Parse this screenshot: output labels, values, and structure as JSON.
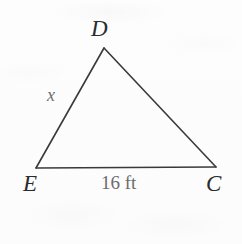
{
  "figure": {
    "type": "geometry-diagram",
    "shape": "triangle",
    "background_color": "#fdfdfd",
    "stroke_color": "#3a3a3a",
    "stroke_width": 1.6,
    "vertices": [
      {
        "name": "D",
        "label": "D",
        "x": 104,
        "y": 48,
        "label_position": "above"
      },
      {
        "name": "E",
        "label": "E",
        "x": 36,
        "y": 168,
        "label_position": "below-left"
      },
      {
        "name": "C",
        "label": "C",
        "x": 216,
        "y": 167,
        "label_position": "below-right"
      }
    ],
    "edges": [
      {
        "from": "D",
        "to": "E",
        "label": "x",
        "label_color": "#6f6f6f"
      },
      {
        "from": "D",
        "to": "C",
        "label": "",
        "label_color": ""
      },
      {
        "from": "E",
        "to": "C",
        "label": "16 ft",
        "label_color": "#6b6b6b"
      }
    ],
    "side_labels": {
      "unknown_side": "x",
      "base_length": "16 ft"
    },
    "vertex_label_color": "#2b2b2b"
  }
}
